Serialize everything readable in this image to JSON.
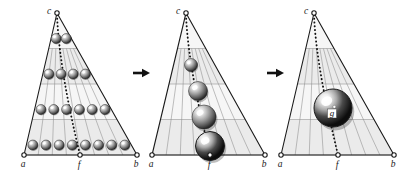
{
  "figure": {
    "name": "triangle-sphere-coarsening-sequence",
    "background_color": "#ffffff",
    "stroke_color": "#1a1a1a",
    "band_fill_color": "#ebebeb",
    "grid_line_color": "#8c8c8c",
    "vertex_marker_fill": "#ffffff",
    "dotted_line_color": "#111111",
    "panel_count": 3,
    "arrow_glyph": "➤"
  },
  "panels": [
    {
      "id": "panel-1",
      "stage": 1,
      "apex_label": "c",
      "left_label": "a",
      "mid_label": "f",
      "right_label": "b",
      "apex": {
        "x": 57,
        "y": 13
      },
      "left": {
        "x": 24,
        "y": 155
      },
      "right": {
        "x": 137,
        "y": 155
      },
      "mid": {
        "x": 80,
        "y": 155
      },
      "description": "many small spheres arranged on grid",
      "sphere_rows": [
        {
          "row": 1,
          "count": 2,
          "radius": 5.0,
          "y": 64
        },
        {
          "row": 2,
          "count": 4,
          "radius": 5.0,
          "y": 92
        },
        {
          "row": 3,
          "count": 6,
          "radius": 5.0,
          "y": 120
        },
        {
          "row": 4,
          "count": 8,
          "radius": 5.0,
          "y": 147
        }
      ],
      "sphere_total": 20
    },
    {
      "id": "panel-2",
      "stage": 2,
      "apex_label": "c",
      "left_label": "a",
      "mid_label": "f",
      "right_label": "b",
      "apex": {
        "x": 186,
        "y": 13
      },
      "left": {
        "x": 152,
        "y": 155
      },
      "right": {
        "x": 265,
        "y": 155
      },
      "mid": {
        "x": 210,
        "y": 155
      },
      "description": "four spheres of increasing size along the dotted line",
      "spheres": [
        {
          "cx": 191,
          "cy": 65,
          "r": 6.5
        },
        {
          "cx": 198,
          "cy": 91,
          "r": 9.5
        },
        {
          "cx": 204,
          "cy": 117,
          "r": 12.0
        },
        {
          "cx": 210,
          "cy": 146,
          "r": 14.5
        }
      ]
    },
    {
      "id": "panel-3",
      "stage": 3,
      "apex_label": "c",
      "left_label": "a",
      "mid_label": "f",
      "right_label": "b",
      "apex": {
        "x": 314,
        "y": 13
      },
      "left": {
        "x": 281,
        "y": 155
      },
      "right": {
        "x": 394,
        "y": 155
      },
      "mid": {
        "x": 338,
        "y": 155
      },
      "description": "single large sphere labelled g",
      "spheres": [
        {
          "cx": 333,
          "cy": 108,
          "r": 19.0,
          "label": "g"
        }
      ]
    }
  ],
  "arrows": [
    {
      "id": "arrow-1",
      "x": 133,
      "y": 73,
      "length": 15,
      "label": ""
    },
    {
      "id": "arrow-2",
      "x": 267,
      "y": 73,
      "length": 15,
      "label": ""
    }
  ]
}
